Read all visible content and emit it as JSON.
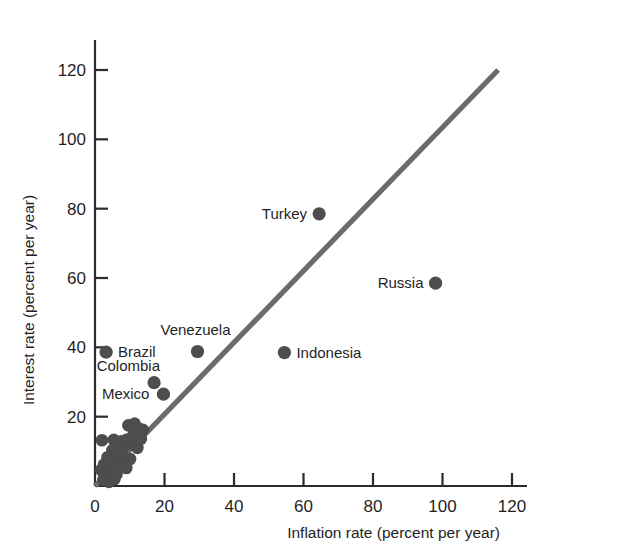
{
  "chart_data": {
    "type": "scatter",
    "title": "",
    "xlabel": "Inflation rate (percent per year)",
    "ylabel": "Interest rate (percent per year)",
    "xlim": [
      0,
      132
    ],
    "ylim": [
      0,
      132
    ],
    "xticks": [
      0,
      20,
      40,
      60,
      80,
      100,
      120
    ],
    "xtick_labels": [
      "0",
      "20",
      "40",
      "60",
      "80",
      "100",
      "120"
    ],
    "yticks": [
      20,
      40,
      60,
      80,
      100,
      120
    ],
    "ytick_labels": [
      "20",
      "40",
      "60",
      "80",
      "100",
      "120"
    ],
    "grid": false,
    "legend": "none",
    "marker_color": "#4d4d4d",
    "line_color": "#6b6b6b",
    "axis_color": "#2b2b2b",
    "reference_line": {
      "name": "45-degree line",
      "x": [
        0,
        116
      ],
      "y": [
        0,
        120
      ]
    },
    "labeled_points": [
      {
        "label": "Turkey",
        "x": 64.5,
        "y": 78.5,
        "label_side": "left"
      },
      {
        "label": "Russia",
        "x": 98.0,
        "y": 58.5,
        "label_side": "left"
      },
      {
        "label": "Indonesia",
        "x": 54.5,
        "y": 38.5,
        "label_side": "right"
      },
      {
        "label": "Venezuela",
        "x": 29.5,
        "y": 38.8,
        "label_side": "above"
      },
      {
        "label": "Brazil",
        "x": 3.2,
        "y": 38.6,
        "label_side": "right"
      },
      {
        "label": "Colombia",
        "x": 17.0,
        "y": 29.8,
        "label_side": "left"
      },
      {
        "label": "Mexico",
        "x": 19.7,
        "y": 26.5,
        "label_side": "left"
      }
    ],
    "unlabeled_points": [
      {
        "x": 2.0,
        "y": 13.2
      },
      {
        "x": 5.4,
        "y": 13.3
      },
      {
        "x": 9.6,
        "y": 17.5
      },
      {
        "x": 11.4,
        "y": 18.0
      },
      {
        "x": 12.6,
        "y": 16.6
      },
      {
        "x": 13.8,
        "y": 16.2
      },
      {
        "x": 9.2,
        "y": 13.4
      },
      {
        "x": 10.6,
        "y": 12.0
      },
      {
        "x": 12.2,
        "y": 11.0
      },
      {
        "x": 5.0,
        "y": 10.3
      },
      {
        "x": 6.4,
        "y": 9.5
      },
      {
        "x": 7.9,
        "y": 10.6
      },
      {
        "x": 3.6,
        "y": 8.3
      },
      {
        "x": 5.1,
        "y": 7.6
      },
      {
        "x": 6.8,
        "y": 7.9
      },
      {
        "x": 8.5,
        "y": 7.2
      },
      {
        "x": 10.1,
        "y": 7.8
      },
      {
        "x": 2.6,
        "y": 6.2
      },
      {
        "x": 4.2,
        "y": 5.6
      },
      {
        "x": 5.9,
        "y": 5.4
      },
      {
        "x": 7.3,
        "y": 5.7
      },
      {
        "x": 9.0,
        "y": 5.2
      },
      {
        "x": 3.0,
        "y": 3.6
      },
      {
        "x": 4.6,
        "y": 3.2
      },
      {
        "x": 6.2,
        "y": 3.4
      },
      {
        "x": 2.4,
        "y": 1.8
      },
      {
        "x": 4.0,
        "y": 1.2
      },
      {
        "x": 5.6,
        "y": 2.0
      },
      {
        "x": 1.8,
        "y": 4.6
      },
      {
        "x": 11.0,
        "y": 14.6
      },
      {
        "x": 7.6,
        "y": 12.9
      },
      {
        "x": 13.2,
        "y": 13.6
      }
    ]
  }
}
